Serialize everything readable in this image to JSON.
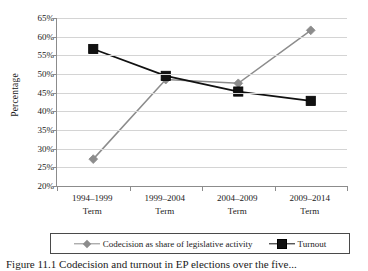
{
  "figure": {
    "caption": "Figure 11.1  Codecision and turnout in EP elections over the five...",
    "y_axis_title": "Percentage"
  },
  "chart_data": {
    "type": "line",
    "title": "",
    "xlabel": "",
    "ylabel": "Percentage",
    "ylim": [
      20,
      65
    ],
    "ytick_step": 5,
    "ytick_labels": [
      "65%",
      "60%",
      "55%",
      "50%",
      "45%",
      "40%",
      "35%",
      "30%",
      "25%",
      "20%"
    ],
    "ytick_values": [
      65,
      60,
      55,
      50,
      45,
      40,
      35,
      30,
      25,
      20
    ],
    "grid": true,
    "grid_axis": "y",
    "legend_position": "bottom",
    "categories": [
      "1994–1999\nTerm",
      "1999–2004\nTerm",
      "2004–2009\nTerm",
      "2009–2014\nTerm"
    ],
    "category_lines": [
      {
        "years": "1994–1999",
        "term": "Term"
      },
      {
        "years": "1999–2004",
        "term": "Term"
      },
      {
        "years": "2004–2009",
        "term": "Term"
      },
      {
        "years": "2009–2014",
        "term": "Term"
      }
    ],
    "series": [
      {
        "name": "Codecision as share of legislative activity",
        "values": [
          27.2,
          48.5,
          47.5,
          61.7
        ],
        "color": "#8c8c8c",
        "marker": "diamond"
      },
      {
        "name": "Turnout",
        "values": [
          56.7,
          49.5,
          45.3,
          42.8
        ],
        "color": "#111111",
        "marker": "square"
      }
    ]
  },
  "legend": {
    "entries": [
      {
        "label": "Codecision as share of legislative activity",
        "marker": "diamond-marker",
        "color": "#8c8c8c"
      },
      {
        "label": "Turnout",
        "marker": "square-marker",
        "color": "#111111"
      }
    ]
  }
}
